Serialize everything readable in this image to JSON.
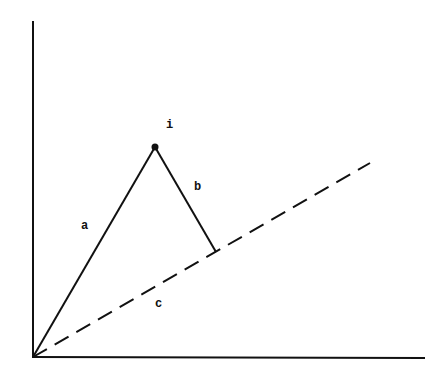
{
  "diagram": {
    "type": "vector-projection",
    "colors": {
      "stroke": "#111111",
      "background": "#ffffff"
    },
    "origin": {
      "x": 33,
      "y": 357
    },
    "axes": {
      "y_axis": {
        "x1": 33,
        "y1": 357,
        "x2": 33,
        "y2": 22
      },
      "x_axis": {
        "x1": 33,
        "y1": 357,
        "x2": 424,
        "y2": 358
      }
    },
    "point_i": {
      "label": "i",
      "x": 155,
      "y": 147,
      "label_x": 166,
      "label_y": 128
    },
    "lines": {
      "a": {
        "label": "a",
        "style": "solid",
        "x1": 33,
        "y1": 357,
        "x2": 155,
        "y2": 147,
        "label_x": 81,
        "label_y": 229
      },
      "b": {
        "label": "b",
        "style": "solid",
        "x1": 155,
        "y1": 147,
        "x2": 216,
        "y2": 252,
        "label_x": 194,
        "label_y": 190
      },
      "c": {
        "label": "c",
        "style": "dashed",
        "x1": 33,
        "y1": 357,
        "x2": 370,
        "y2": 163,
        "label_x": 155,
        "label_y": 307
      }
    }
  }
}
